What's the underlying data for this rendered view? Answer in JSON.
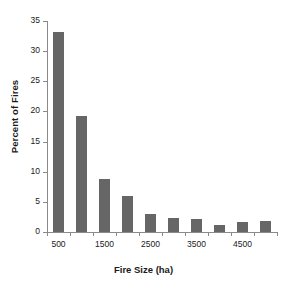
{
  "chart_data": {
    "type": "bar",
    "title": "",
    "xlabel": "Fire Size (ha)",
    "ylabel": "Percent of Fires",
    "categories": [
      "500",
      "1000",
      "1500",
      "2000",
      "2500",
      "3000",
      "3500",
      "4000",
      "4500",
      "5000"
    ],
    "values": [
      33.2,
      19.2,
      8.8,
      6.0,
      3.0,
      2.3,
      2.2,
      1.1,
      1.7,
      1.8
    ],
    "ylim": [
      0,
      35
    ],
    "ytick_labels": [
      "0",
      "5",
      "10",
      "15",
      "20",
      "25",
      "30",
      "35"
    ],
    "ytick_values": [
      0,
      5,
      10,
      15,
      20,
      25,
      30,
      35
    ],
    "xtick_labels": [
      "500",
      "1500",
      "2500",
      "3500",
      "4500"
    ],
    "xtick_label_indices": [
      0,
      2,
      4,
      6,
      8
    ],
    "grid": false,
    "legend": false,
    "bar_color": "#666666",
    "axis_color": "#8a8a8a",
    "text_color": "#1a1a1a"
  }
}
